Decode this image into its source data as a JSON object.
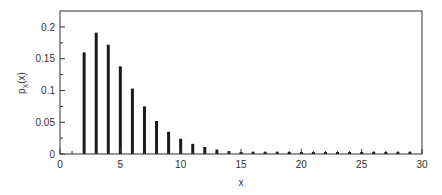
{
  "chart_data": {
    "type": "bar",
    "subtype": "stem",
    "title": "",
    "xlabel": "x",
    "ylabel": "p_X(x)",
    "ylabel_main": "p",
    "ylabel_sub": "X",
    "ylabel_arg": "(x)",
    "xlim": [
      0,
      30
    ],
    "ylim": [
      0,
      0.22
    ],
    "xticks": [
      0,
      5,
      10,
      15,
      20,
      25,
      30
    ],
    "xtick_labels": [
      "0",
      "5",
      "10",
      "15",
      "20",
      "25",
      "30"
    ],
    "yticks": [
      0,
      0.05,
      0.1,
      0.15,
      0.2
    ],
    "ytick_labels": [
      "0",
      "0.05",
      "0.1",
      "0.15",
      "0.2"
    ],
    "grid": false,
    "legend": null,
    "x": [
      2,
      3,
      4,
      5,
      6,
      7,
      8,
      9,
      10,
      11,
      12,
      13,
      14,
      15,
      16,
      17,
      18,
      19,
      20,
      21,
      22,
      23,
      24,
      25,
      26,
      27,
      28,
      29
    ],
    "values": [
      0.16,
      0.191,
      0.172,
      0.138,
      0.103,
      0.075,
      0.052,
      0.035,
      0.024,
      0.016,
      0.011,
      0.007,
      0.0045,
      0.003,
      0.002,
      0.0013,
      0.0009,
      0.0006,
      0.0004,
      0.0003,
      0.0002,
      0.0001,
      0.0001,
      0.0001,
      0.0,
      0.0,
      0.0,
      0.0
    ]
  }
}
